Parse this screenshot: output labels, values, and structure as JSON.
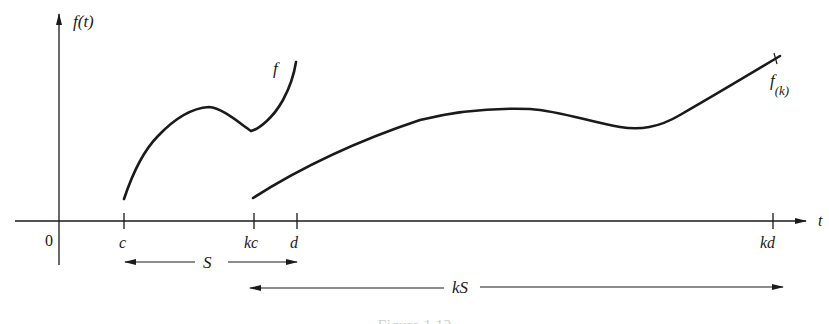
{
  "diagram": {
    "axes": {
      "y_label": "f(t)",
      "x_label": "t",
      "origin_label": "0"
    },
    "ticks": [
      {
        "id": "c",
        "label": "c",
        "x": 124
      },
      {
        "id": "kc",
        "label": "kc",
        "x": 254
      },
      {
        "id": "d",
        "label": "d",
        "x": 297
      },
      {
        "id": "kd",
        "label": "kd",
        "x": 773
      }
    ],
    "curves": [
      {
        "id": "f",
        "label": "f"
      },
      {
        "id": "f_k",
        "label": "f",
        "subscript": "(k)"
      }
    ],
    "intervals": [
      {
        "id": "S",
        "label": "S",
        "from": "c",
        "to": "d"
      },
      {
        "id": "kS",
        "label": "kS",
        "from": "kc",
        "to": "kd"
      }
    ],
    "caption": "Figure 1.13"
  },
  "colors": {
    "ink": "#1a1a1a",
    "background": "#ffffff"
  }
}
